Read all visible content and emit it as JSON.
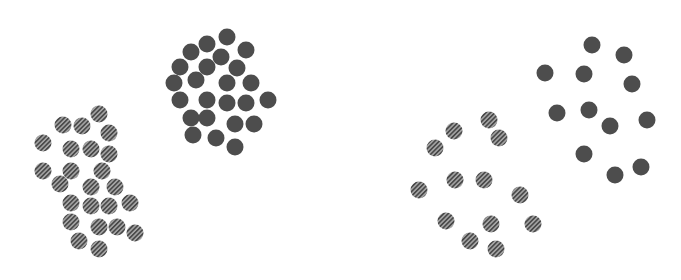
{
  "diagram": {
    "colors": {
      "solid": "#4d4d4d",
      "striped_fill": "#9a9a9a",
      "stripe": "#4a4a4a",
      "background": "#ffffff"
    },
    "dot_radius": 8.5,
    "panels": [
      {
        "name": "left-dense",
        "solid": [
          [
            227,
            37
          ],
          [
            207,
            44
          ],
          [
            246,
            50
          ],
          [
            191,
            52
          ],
          [
            221,
            57
          ],
          [
            180,
            67
          ],
          [
            207,
            67
          ],
          [
            237,
            68
          ],
          [
            174,
            83
          ],
          [
            196,
            80
          ],
          [
            227,
            83
          ],
          [
            251,
            83
          ],
          [
            180,
            100
          ],
          [
            207,
            100
          ],
          [
            227,
            103
          ],
          [
            246,
            103
          ],
          [
            268,
            100
          ],
          [
            191,
            118
          ],
          [
            207,
            118
          ],
          [
            235,
            124
          ],
          [
            254,
            124
          ],
          [
            193,
            135
          ],
          [
            216,
            138
          ],
          [
            235,
            147
          ]
        ],
        "striped": [
          [
            99,
            114
          ],
          [
            63,
            125
          ],
          [
            82,
            126
          ],
          [
            109,
            133
          ],
          [
            43,
            143
          ],
          [
            71,
            149
          ],
          [
            91,
            149
          ],
          [
            109,
            154
          ],
          [
            43,
            171
          ],
          [
            71,
            171
          ],
          [
            102,
            171
          ],
          [
            60,
            184
          ],
          [
            91,
            187
          ],
          [
            115,
            187
          ],
          [
            71,
            203
          ],
          [
            91,
            206
          ],
          [
            109,
            206
          ],
          [
            130,
            203
          ],
          [
            71,
            222
          ],
          [
            99,
            227
          ],
          [
            117,
            227
          ],
          [
            135,
            233
          ],
          [
            79,
            241
          ],
          [
            99,
            249
          ]
        ]
      },
      {
        "name": "right-sparse",
        "solid": [
          [
            592,
            45
          ],
          [
            624,
            55
          ],
          [
            545,
            73
          ],
          [
            584,
            74
          ],
          [
            632,
            84
          ],
          [
            557,
            113
          ],
          [
            589,
            110
          ],
          [
            610,
            126
          ],
          [
            647,
            120
          ],
          [
            584,
            154
          ],
          [
            615,
            175
          ],
          [
            641,
            167
          ]
        ],
        "striped": [
          [
            489,
            120
          ],
          [
            454,
            131
          ],
          [
            499,
            138
          ],
          [
            435,
            148
          ],
          [
            455,
            180
          ],
          [
            484,
            180
          ],
          [
            419,
            190
          ],
          [
            520,
            195
          ],
          [
            446,
            221
          ],
          [
            491,
            224
          ],
          [
            533,
            224
          ],
          [
            470,
            241
          ],
          [
            496,
            249
          ]
        ]
      }
    ]
  }
}
